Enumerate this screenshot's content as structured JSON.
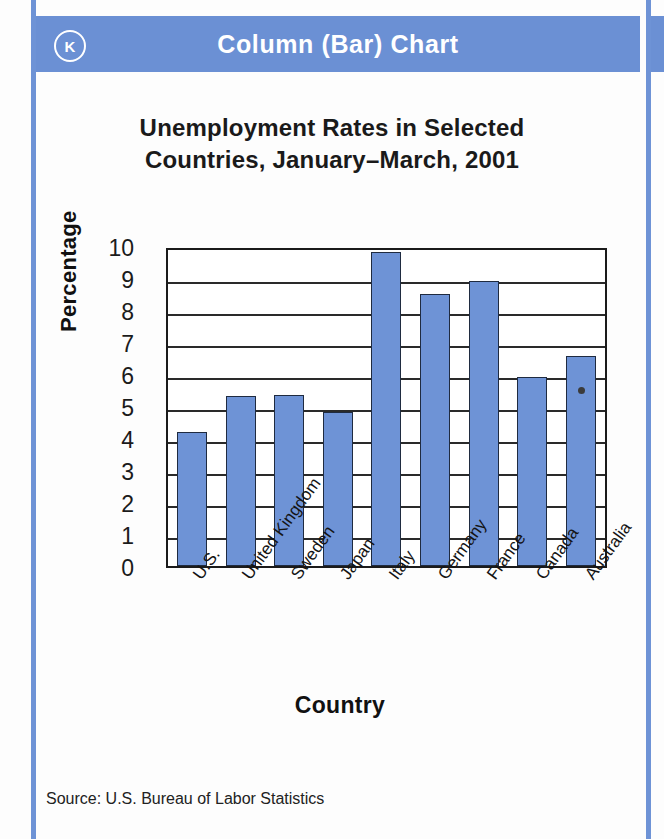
{
  "header": {
    "badge": "K",
    "title": "Column (Bar) Chart",
    "accent_color": "#6b90d4"
  },
  "footer": {
    "source": "Source: U.S. Bureau of Labor Statistics"
  },
  "chart_data": {
    "type": "bar",
    "title": "Unemployment Rates in Selected Countries, January–March, 2001",
    "title_line1": "Unemployment Rates in Selected",
    "title_line2": "Countries, January–March, 2001",
    "xlabel": "Country",
    "ylabel": "Percentage",
    "categories": [
      "U.S.",
      "United Kingdom",
      "Sweden",
      "Japan",
      "Italy",
      "Germany",
      "France",
      "Canada",
      "Australia"
    ],
    "values": [
      4.2,
      5.3,
      5.35,
      4.8,
      9.8,
      8.5,
      8.9,
      5.9,
      6.55
    ],
    "ylim": [
      0,
      10
    ],
    "yticks": [
      10,
      9,
      8,
      7,
      6,
      5,
      4,
      3,
      2,
      1,
      0
    ],
    "grid": true,
    "legend": "none",
    "bar_color": "#6e93d6",
    "bar_edge_color": "#1f2b40",
    "annotation_dot": {
      "category": "Australia",
      "visible": true
    }
  }
}
